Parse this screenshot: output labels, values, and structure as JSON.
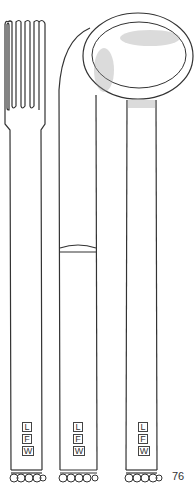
{
  "illustration": {
    "subject": "cutlery set: fork, knife, spoon",
    "items": [
      {
        "name": "fork",
        "monogram": [
          "L",
          "F",
          "W"
        ]
      },
      {
        "name": "knife",
        "monogram": [
          "L",
          "F",
          "W"
        ]
      },
      {
        "name": "spoon",
        "monogram": [
          "L",
          "F",
          "W"
        ]
      }
    ],
    "page_number": "76",
    "colors": {
      "line": "#333333",
      "background": "#ffffff",
      "shade": "#999999"
    }
  }
}
